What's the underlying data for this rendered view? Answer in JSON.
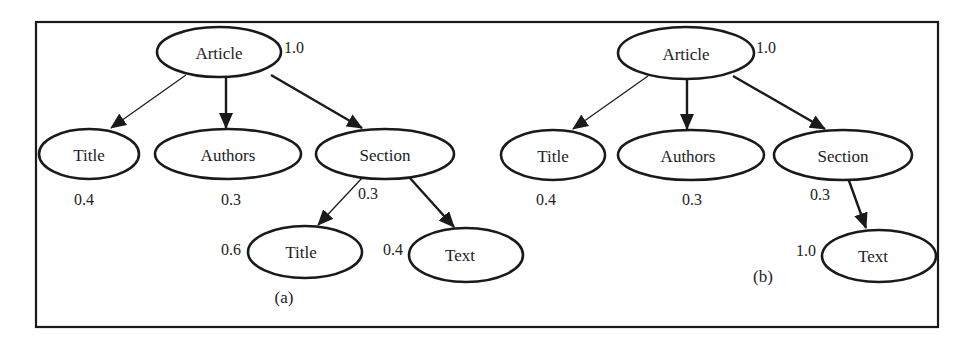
{
  "figure": {
    "panels": [
      {
        "id": "a",
        "caption": "(a)",
        "nodes": [
          {
            "id": "article",
            "label": "Article",
            "weight": "1.0"
          },
          {
            "id": "title",
            "label": "Title",
            "weight": "0.4"
          },
          {
            "id": "authors",
            "label": "Authors",
            "weight": "0.3"
          },
          {
            "id": "section",
            "label": "Section",
            "weight": "0.3"
          },
          {
            "id": "section-title",
            "label": "Title",
            "weight": "0.6"
          },
          {
            "id": "section-text",
            "label": "Text",
            "weight": "0.4"
          }
        ],
        "edges": [
          {
            "from": "article",
            "to": "title",
            "style": "thin"
          },
          {
            "from": "article",
            "to": "authors",
            "style": "thick"
          },
          {
            "from": "article",
            "to": "section",
            "style": "thick"
          },
          {
            "from": "section",
            "to": "section-title",
            "style": "thin"
          },
          {
            "from": "section",
            "to": "section-text",
            "style": "thick"
          }
        ]
      },
      {
        "id": "b",
        "caption": "(b)",
        "nodes": [
          {
            "id": "article",
            "label": "Article",
            "weight": "1.0"
          },
          {
            "id": "title",
            "label": "Title",
            "weight": "0.4"
          },
          {
            "id": "authors",
            "label": "Authors",
            "weight": "0.3"
          },
          {
            "id": "section",
            "label": "Section",
            "weight": "0.3"
          },
          {
            "id": "section-text",
            "label": "Text",
            "weight": "1.0"
          }
        ],
        "edges": [
          {
            "from": "article",
            "to": "title",
            "style": "thin"
          },
          {
            "from": "article",
            "to": "authors",
            "style": "thick"
          },
          {
            "from": "article",
            "to": "section",
            "style": "thick"
          },
          {
            "from": "section",
            "to": "section-text",
            "style": "thick"
          }
        ]
      }
    ]
  }
}
